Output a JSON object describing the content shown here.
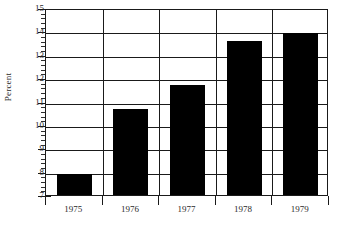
{
  "chart_data": {
    "type": "bar",
    "title": "",
    "subtitle": "",
    "xlabel": "",
    "ylabel": "Percent",
    "categories": [
      "1975",
      "1976",
      "1977",
      "1978",
      "1979"
    ],
    "values": [
      7.9,
      10.7,
      11.7,
      13.6,
      13.95
    ],
    "series": [
      {
        "name": "Percent",
        "values": [
          7.9,
          10.7,
          11.7,
          13.6,
          13.95
        ]
      }
    ],
    "ylim": [
      7,
      15
    ],
    "y_ticks": [
      7,
      8,
      9,
      10,
      11,
      12,
      13,
      14,
      15
    ],
    "y_tick_labels": [
      "7",
      "8",
      "9",
      "10",
      "11",
      "12",
      "13",
      "14",
      "15"
    ],
    "y_minor_tick_interval": 0.2,
    "x_tick_labels": [
      "1975",
      "1976",
      "1977",
      "1978",
      "1979"
    ],
    "grid": true,
    "grid_axes": "both",
    "legend": false,
    "legend_position": "none",
    "bar_color": "#000000",
    "frame_color": "#1a1a1a",
    "background_color": "#ffffff",
    "annotations": []
  }
}
